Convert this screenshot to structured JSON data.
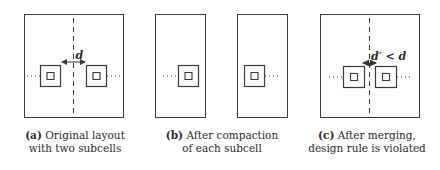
{
  "figure": {
    "panels": [
      {
        "id": "a",
        "tag": "(a)",
        "caption_line1": "Original layout",
        "caption_line2": "with two subcells",
        "spacing_label": "d"
      },
      {
        "id": "b",
        "tag": "(b)",
        "caption_line1": "After compaction",
        "caption_line2": "of each subcell"
      },
      {
        "id": "c",
        "tag": "(c)",
        "caption_line1": "After merging,",
        "caption_line2": "design rule is violated",
        "spacing_label": "d′ < d"
      }
    ],
    "colors": {
      "line": "#3a3a3a",
      "background": "#ffffff"
    }
  }
}
